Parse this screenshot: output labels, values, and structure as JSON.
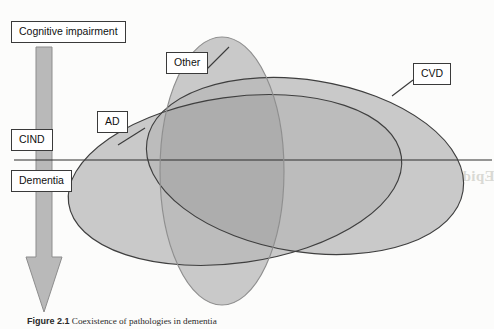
{
  "figure": {
    "kind": "venn-diagram",
    "caption_label": "Figure 2.1",
    "caption_text": "Coexistence of pathologies in dementia",
    "background_color": "#fcfcfb"
  },
  "axis": {
    "spectrum_line": "horizontal divider separating CIND from Dementia",
    "arrow_label": "severity arrow pointing downward",
    "arrow_color": "#b8b8b8"
  },
  "labels": {
    "cognitive_impairment": "Cognitive impairment",
    "cind": "CIND",
    "dementia": "Dementia",
    "ad": "AD",
    "other": "Other",
    "cvd": "CVD"
  },
  "sets": [
    {
      "id": "ad",
      "label": "AD",
      "shape": "ellipse",
      "cx": 235,
      "cy": 180,
      "rx": 168,
      "ry": 83,
      "rotation_deg": -8,
      "fill": "#c9c9c9",
      "stroke": "#3f3f3f"
    },
    {
      "id": "other",
      "label": "Other",
      "shape": "ellipse",
      "cx": 222,
      "cy": 171,
      "rx": 62,
      "ry": 134,
      "rotation_deg": 0,
      "fill": "#c9c9c9",
      "stroke": "#3f3f3f"
    },
    {
      "id": "cvd",
      "label": "CVD",
      "shape": "ellipse",
      "cx": 305,
      "cy": 166,
      "rx": 160,
      "ry": 86,
      "rotation_deg": 9,
      "fill": "#c9c9c9",
      "stroke": "#3f3f3f"
    }
  ],
  "showthrough": {
    "heading": "Epidemiology and Pathology",
    "lines": [
      "this more detail. Neuropathology and the",
      "degenerative disease. The dementia of the",
      "cases. Alzheimer disease is the most"
    ]
  },
  "colors": {
    "fill_single": "#c9c9c9",
    "fill_overlap": "#b2b2b2",
    "stroke": "#3f3f3f",
    "line": "#2e2e2e",
    "box_border": "#3a3a3a",
    "text": "#111111"
  }
}
